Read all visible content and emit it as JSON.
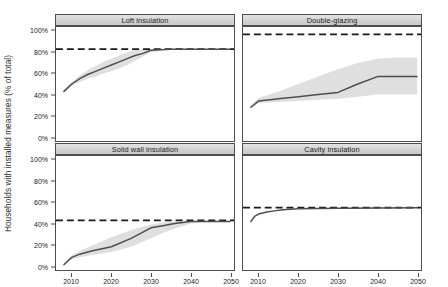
{
  "chart_data": {
    "type": "line",
    "title": "",
    "xlabel": "",
    "ylabel": "Households with installed measures (% of total)",
    "xlim": [
      2006,
      2051
    ],
    "ylim": [
      -4,
      104
    ],
    "xticks": [
      2010,
      2020,
      2030,
      2040,
      2050
    ],
    "xtick_labels": [
      "2010",
      "2020",
      "2030",
      "2040",
      "2050"
    ],
    "yticks": [
      0,
      20,
      40,
      60,
      80,
      100
    ],
    "ytick_labels": [
      "0%",
      "20%",
      "40%",
      "60%",
      "80%",
      "100%"
    ],
    "grid": false,
    "legend": "none",
    "layout": "2x2 facet grid",
    "annotations": [
      "Dashed horizontal line in each panel marks the technical potential / maximum uptake level"
    ],
    "panels": [
      {
        "id": "loft-insulation",
        "label": "Loft insulation",
        "row": 0,
        "col": 0,
        "target_line": 83,
        "series": [
          {
            "name": "central projection",
            "style": "solid",
            "x": [
              2008,
              2010,
              2012,
              2014,
              2016,
              2018,
              2020,
              2022,
              2024,
              2026,
              2028,
              2030,
              2035,
              2040,
              2045,
              2050
            ],
            "values": [
              43,
              50,
              55,
              59,
              62,
              65,
              68,
              71,
              74,
              77,
              79,
              82,
              83,
              83,
              83,
              83
            ]
          },
          {
            "name": "uncertainty band upper",
            "style": "ribbon",
            "x": [
              2008,
              2010,
              2012,
              2014,
              2016,
              2018,
              2020,
              2022,
              2024,
              2026,
              2028,
              2030,
              2035,
              2040,
              2045,
              2050
            ],
            "values": [
              44,
              52,
              58,
              63,
              67,
              71,
              74,
              77,
              80,
              82,
              83,
              83,
              83,
              83,
              83,
              83
            ]
          },
          {
            "name": "uncertainty band lower",
            "style": "ribbon",
            "x": [
              2008,
              2010,
              2012,
              2014,
              2016,
              2018,
              2020,
              2022,
              2024,
              2026,
              2028,
              2030,
              2035,
              2040,
              2045,
              2050
            ],
            "values": [
              42,
              48,
              52,
              55,
              57,
              60,
              62,
              65,
              68,
              72,
              76,
              80,
              83,
              83,
              83,
              83
            ]
          }
        ]
      },
      {
        "id": "double-glazing",
        "label": "Double-glazing",
        "row": 0,
        "col": 1,
        "target_line": 97,
        "series": [
          {
            "name": "central projection",
            "style": "solid",
            "x": [
              2008,
              2010,
              2015,
              2020,
              2025,
              2030,
              2035,
              2040,
              2045,
              2050
            ],
            "values": [
              28,
              34,
              36,
              38,
              40,
              42,
              50,
              57,
              57,
              57
            ]
          },
          {
            "name": "uncertainty band upper",
            "style": "ribbon",
            "x": [
              2008,
              2010,
              2015,
              2020,
              2025,
              2030,
              2035,
              2040,
              2045,
              2050
            ],
            "values": [
              30,
              37,
              43,
              50,
              57,
              64,
              70,
              74,
              75,
              75
            ]
          },
          {
            "name": "uncertainty band lower",
            "style": "ribbon",
            "x": [
              2008,
              2010,
              2015,
              2020,
              2025,
              2030,
              2035,
              2040,
              2045,
              2050
            ],
            "values": [
              27,
              32,
              33,
              34,
              35,
              36,
              38,
              40,
              40,
              40
            ]
          }
        ]
      },
      {
        "id": "solid-wall-insulation",
        "label": "Solid wall insulation",
        "row": 1,
        "col": 0,
        "target_line": 43,
        "series": [
          {
            "name": "central projection",
            "style": "solid",
            "x": [
              2008,
              2010,
              2012,
              2015,
              2020,
              2025,
              2030,
              2033,
              2036,
              2040,
              2045,
              2050
            ],
            "values": [
              1,
              8,
              11,
              14,
              18,
              26,
              36,
              38,
              40,
              42,
              42,
              42
            ]
          },
          {
            "name": "uncertainty band upper",
            "style": "ribbon",
            "x": [
              2008,
              2010,
              2012,
              2015,
              2020,
              2025,
              2030,
              2033,
              2036,
              2040,
              2045,
              2050
            ],
            "values": [
              2,
              10,
              14,
              19,
              27,
              34,
              39,
              41,
              42,
              42,
              42,
              42
            ]
          },
          {
            "name": "uncertainty band lower",
            "style": "ribbon",
            "x": [
              2008,
              2010,
              2012,
              2015,
              2020,
              2025,
              2030,
              2033,
              2036,
              2040,
              2045,
              2050
            ],
            "values": [
              1,
              6,
              8,
              10,
              13,
              18,
              26,
              31,
              35,
              40,
              42,
              42
            ]
          }
        ]
      },
      {
        "id": "cavity-insulation",
        "label": "Cavity insulation",
        "row": 1,
        "col": 1,
        "target_line": 55,
        "series": [
          {
            "name": "central projection",
            "style": "solid",
            "x": [
              2008,
              2009,
              2010,
              2012,
              2014,
              2016,
              2018,
              2020,
              2025,
              2030,
              2040,
              2050
            ],
            "values": [
              42,
              47,
              49,
              51,
              52,
              53,
              53.5,
              54,
              54.3,
              54.6,
              54.8,
              55
            ]
          }
        ]
      }
    ],
    "colors": {
      "line": "#4d4d4d",
      "band": "#d9d9d9",
      "target": "#1a1a1a",
      "strip_bg": "#d4d4d4",
      "border": "#4d4d4d",
      "background": "#ffffff"
    }
  }
}
